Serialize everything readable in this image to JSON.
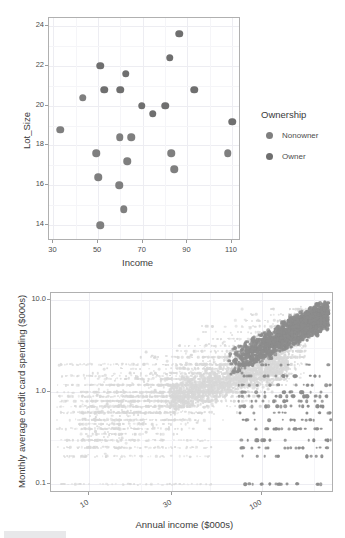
{
  "page": {
    "width": 345,
    "height": 538,
    "background": "#ffffff"
  },
  "colors": {
    "nonowner": "#7f7f7f",
    "owner": "#6f6f6f",
    "light_cluster": "#d8d8d8",
    "dark_cluster": "#8c8c8c",
    "panel_border": "#b0b0b0",
    "gridline": "#ededf2",
    "axis_text": "#4d4d4d",
    "title_text": "#3a3a3a"
  },
  "chart_data": [
    {
      "id": "riding-mowers-scatter",
      "type": "scatter",
      "title": "",
      "xlabel": "Income",
      "ylabel": "Lot_Size",
      "xlim": [
        28,
        114
      ],
      "ylim": [
        13.2,
        24.4
      ],
      "xticks": [
        30,
        50,
        70,
        90,
        110
      ],
      "yticks": [
        14,
        16,
        18,
        20,
        22,
        24
      ],
      "grid": true,
      "legend": {
        "title": "Ownership",
        "position": "right",
        "entries": [
          {
            "label": "Nonowner",
            "color": "#7f7f7f"
          },
          {
            "label": "Owner",
            "color": "#6f6f6f"
          }
        ]
      },
      "series": [
        {
          "name": "Nonowner",
          "color": "#7f7f7f",
          "points": [
            {
              "x": 33.0,
              "y": 18.8
            },
            {
              "x": 43.2,
              "y": 20.4
            },
            {
              "x": 49.2,
              "y": 17.6
            },
            {
              "x": 50.1,
              "y": 16.4
            },
            {
              "x": 51.0,
              "y": 14.0
            },
            {
              "x": 59.4,
              "y": 16.0
            },
            {
              "x": 61.5,
              "y": 14.8
            },
            {
              "x": 63.0,
              "y": 17.2
            },
            {
              "x": 59.6,
              "y": 18.4
            },
            {
              "x": 64.8,
              "y": 18.4
            },
            {
              "x": 82.8,
              "y": 17.6
            },
            {
              "x": 84.0,
              "y": 16.8
            },
            {
              "x": 108.0,
              "y": 17.6
            }
          ]
        },
        {
          "name": "Owner",
          "color": "#6f6f6f",
          "points": [
            {
              "x": 51.0,
              "y": 22.0
            },
            {
              "x": 52.8,
              "y": 20.8
            },
            {
              "x": 60.0,
              "y": 20.8
            },
            {
              "x": 62.4,
              "y": 21.6
            },
            {
              "x": 69.6,
              "y": 20.0
            },
            {
              "x": 74.4,
              "y": 19.6
            },
            {
              "x": 80.0,
              "y": 20.0
            },
            {
              "x": 82.0,
              "y": 22.4
            },
            {
              "x": 86.4,
              "y": 23.6
            },
            {
              "x": 93.0,
              "y": 20.8
            },
            {
              "x": 110.1,
              "y": 19.2
            }
          ]
        }
      ]
    },
    {
      "id": "credit-card-spending-scatter",
      "type": "scatter",
      "title": "",
      "xlabel": "Annual income ($000s)",
      "ylabel": "Monthly average credit card spending ($000s)",
      "xscale": "log",
      "yscale": "log",
      "xlim": [
        6,
        260
      ],
      "ylim": [
        0.08,
        12
      ],
      "xticks": [
        10,
        30,
        100
      ],
      "yticks": [
        0.1,
        1.0,
        10.0
      ],
      "ytick_labels": [
        "0.1",
        "1.0",
        "10.0"
      ],
      "grid": true,
      "legend": null,
      "series": [
        {
          "name": "Light cluster",
          "color": "#d8d8d8",
          "description": "Large diffuse light-grey point mass spanning low-to-mid income and the full spending range, densest between income 20-90 and spending 0.2-3"
        },
        {
          "name": "Dark cluster",
          "color": "#8c8c8c",
          "description": "Darker grey point mass concentrated at high income (above ~80) rising toward 10.0 spending, with a scattered tail down to 0.1"
        }
      ]
    }
  ]
}
